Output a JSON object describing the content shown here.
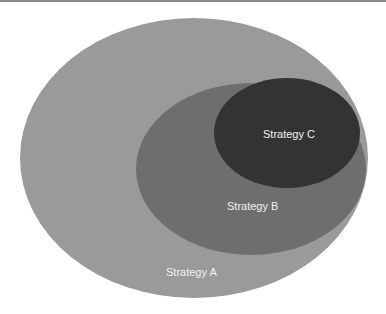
{
  "diagram": {
    "type": "nested-venn",
    "sets": [
      {
        "label": "Strategy A",
        "color": "#9a9a9a"
      },
      {
        "label": "Strategy B",
        "color": "#6e6e6e"
      },
      {
        "label": "Strategy C",
        "color": "#333333"
      }
    ]
  }
}
